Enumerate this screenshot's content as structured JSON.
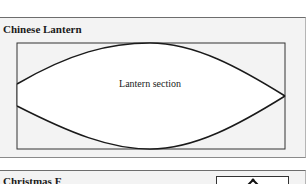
{
  "panels": [
    {
      "title": "Chinese Lantern",
      "diagram": {
        "label": "Lantern section",
        "shape": "lens",
        "colors": {
          "fill": "#ffffff",
          "background": "#f3f3f3",
          "stroke": "#1a1a1a"
        }
      }
    },
    {
      "title": "Christmas F",
      "icon": "up-arrow-icon"
    }
  ]
}
